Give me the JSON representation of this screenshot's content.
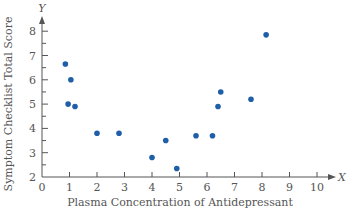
{
  "chart_data": {
    "type": "scatter",
    "title": "",
    "xlabel": "Plasma Concentration of Antidepressant",
    "ylabel": "Symptom Checklist Total Score",
    "x_axis_letter": "X",
    "y_axis_letter": "Y",
    "xlim": [
      0,
      10
    ],
    "ylim": [
      2,
      8
    ],
    "x_ticks": [
      0,
      1,
      2,
      3,
      4,
      5,
      6,
      7,
      8,
      9,
      10
    ],
    "y_ticks": [
      2,
      3,
      4,
      5,
      6,
      7,
      8
    ],
    "grid": false,
    "legend": null,
    "point_color": "#1f5fa8",
    "points": [
      {
        "x": 0.85,
        "y": 6.65
      },
      {
        "x": 1.05,
        "y": 6.0
      },
      {
        "x": 0.95,
        "y": 5.0
      },
      {
        "x": 1.2,
        "y": 4.9
      },
      {
        "x": 2.0,
        "y": 3.8
      },
      {
        "x": 2.8,
        "y": 3.8
      },
      {
        "x": 4.0,
        "y": 2.8
      },
      {
        "x": 4.5,
        "y": 3.5
      },
      {
        "x": 4.9,
        "y": 2.35
      },
      {
        "x": 5.6,
        "y": 3.7
      },
      {
        "x": 6.2,
        "y": 3.7
      },
      {
        "x": 6.4,
        "y": 4.9
      },
      {
        "x": 6.5,
        "y": 5.5
      },
      {
        "x": 7.6,
        "y": 5.2
      },
      {
        "x": 8.15,
        "y": 7.85
      }
    ]
  }
}
